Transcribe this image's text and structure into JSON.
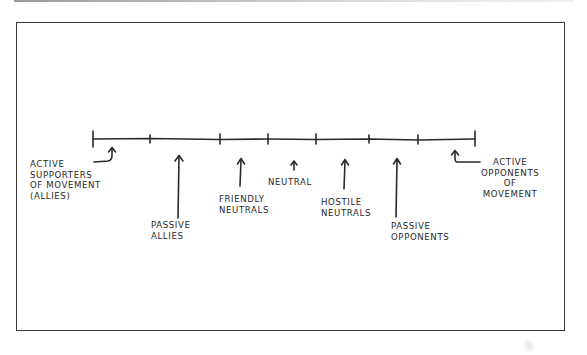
{
  "diagram": {
    "type": "spectrum-line",
    "colors": {
      "ink": "#2a2a2a",
      "frame": "#3a3a3a",
      "background": "#ffffff"
    },
    "labels": {
      "active_supporters": "ACTIVE\nSUPPORTERS\nOF MOVEMENT\n(ALLIES)",
      "passive_allies": "PASSIVE\nALLIES",
      "friendly_neutrals": "FRIENDLY\nNEUTRALS",
      "neutral": "NEUTRAL",
      "hostile_neutrals": "HOSTILE\nNEUTRALS",
      "passive_opponents": "PASSIVE\nOPPONENTS",
      "active_opponents": "ACTIVE\nOPPONENTS\nOF\nMOVEMENT"
    },
    "spectrum_order": [
      "Active supporters of movement (allies)",
      "Passive allies",
      "Friendly neutrals",
      "Neutral",
      "Hostile neutrals",
      "Passive opponents",
      "Active opponents of movement"
    ]
  }
}
